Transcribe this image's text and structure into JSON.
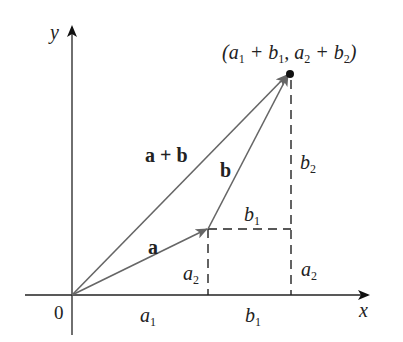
{
  "diagram": {
    "axes": {
      "x_label": "x",
      "y_label": "y",
      "origin_label": "0"
    },
    "vectors": [
      {
        "name": "a",
        "label": "a"
      },
      {
        "name": "b",
        "label": "b"
      },
      {
        "name": "a+b",
        "label": "a + b"
      }
    ],
    "point_label": {
      "open": "(a",
      "s1": "1",
      "plus1": " + b",
      "s2": "1",
      "comma": ", a",
      "s3": "2",
      "plus2": " + b",
      "s4": "2",
      "close": ")"
    },
    "component_labels": {
      "a1": {
        "base": "a",
        "sub": "1"
      },
      "a2_left": {
        "base": "a",
        "sub": "2"
      },
      "a2_right": {
        "base": "a",
        "sub": "2"
      },
      "b1_axis": {
        "base": "b",
        "sub": "1"
      },
      "b1_mid": {
        "base": "b",
        "sub": "1"
      },
      "b2": {
        "base": "b",
        "sub": "2"
      }
    },
    "colors": {
      "axis": "#222222",
      "vector": "#6b6b6b",
      "dashed": "#222222",
      "point": "#111111"
    }
  }
}
